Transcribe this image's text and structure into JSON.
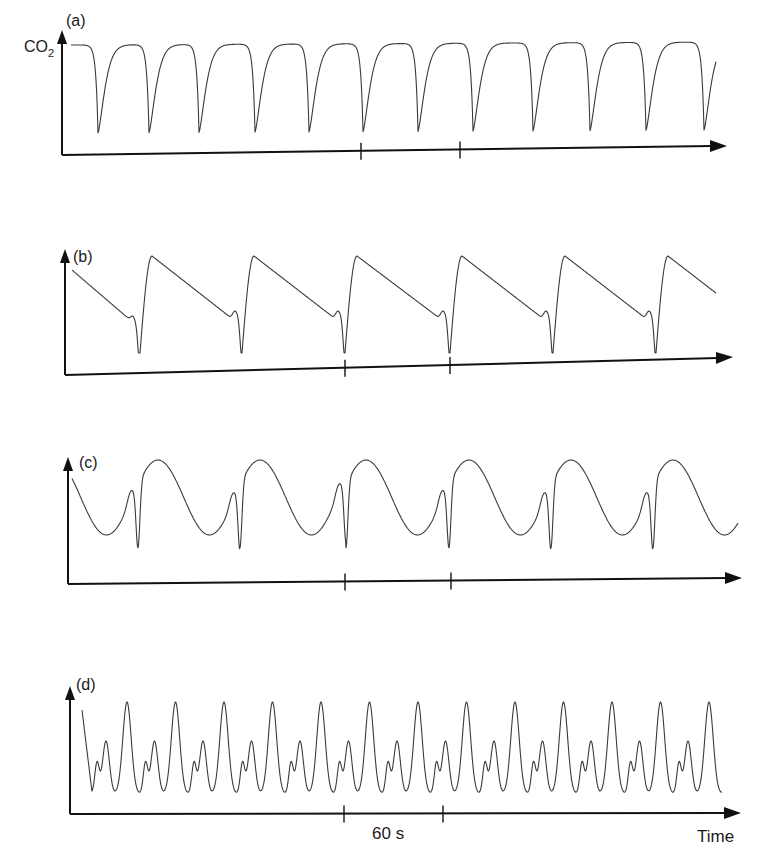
{
  "figure": {
    "y_quantity": "CO₂",
    "x_quantity": "Time",
    "scale_bar_label": "60 s"
  },
  "chart_data": [
    {
      "panel": "(a)",
      "type": "line",
      "title": "(a)",
      "ylabel": "CO2",
      "xlabel": "",
      "description": "Regular breathing: flat plateaus with sharp downward dips",
      "grid": false,
      "baseline_y": 45,
      "trough_y": 133,
      "trough_x": [
        98,
        149,
        199,
        255,
        309,
        363,
        418,
        473,
        533,
        590,
        646,
        704
      ],
      "tick_x": [
        361,
        460
      ],
      "tick_interval_s": 60
    },
    {
      "panel": "(b)",
      "type": "line",
      "title": "(b)",
      "description": "Sawtooth pattern: sharp rise after each dip, then slow linear decline",
      "grid": false,
      "peak_y": 256,
      "pre_dip_y": 317,
      "trough_y": 353,
      "trough_x": [
        140,
        242,
        345,
        450,
        553,
        656
      ],
      "tick_x": [
        345,
        450
      ],
      "tick_interval_s": 60
    },
    {
      "panel": "(c)",
      "type": "line",
      "title": "(c)",
      "description": "Sinusoidal oscillation with a sharp dip before each peak",
      "grid": false,
      "peak_y": 460,
      "valley_y": 535,
      "shoulder_y": 500,
      "trough_y": 553,
      "trough_x": [
        138,
        240,
        346,
        449,
        551,
        653
      ],
      "tick_x": [
        345,
        451
      ],
      "tick_interval_s": 60
    },
    {
      "panel": "(d)",
      "type": "line",
      "title": "(d)",
      "description": "Fast oscillation: repeating small, medium, and tall peaks",
      "grid": false,
      "tall_peak_y": 702,
      "medium_peak_y": 741,
      "small_peak_y": 763,
      "min_y": 794,
      "tall_peak_x_first": 127,
      "period_px": 48.5,
      "cycles": 13,
      "tick_x": [
        344,
        443
      ],
      "tick_interval_s": 60,
      "xlabel": "Time"
    }
  ]
}
